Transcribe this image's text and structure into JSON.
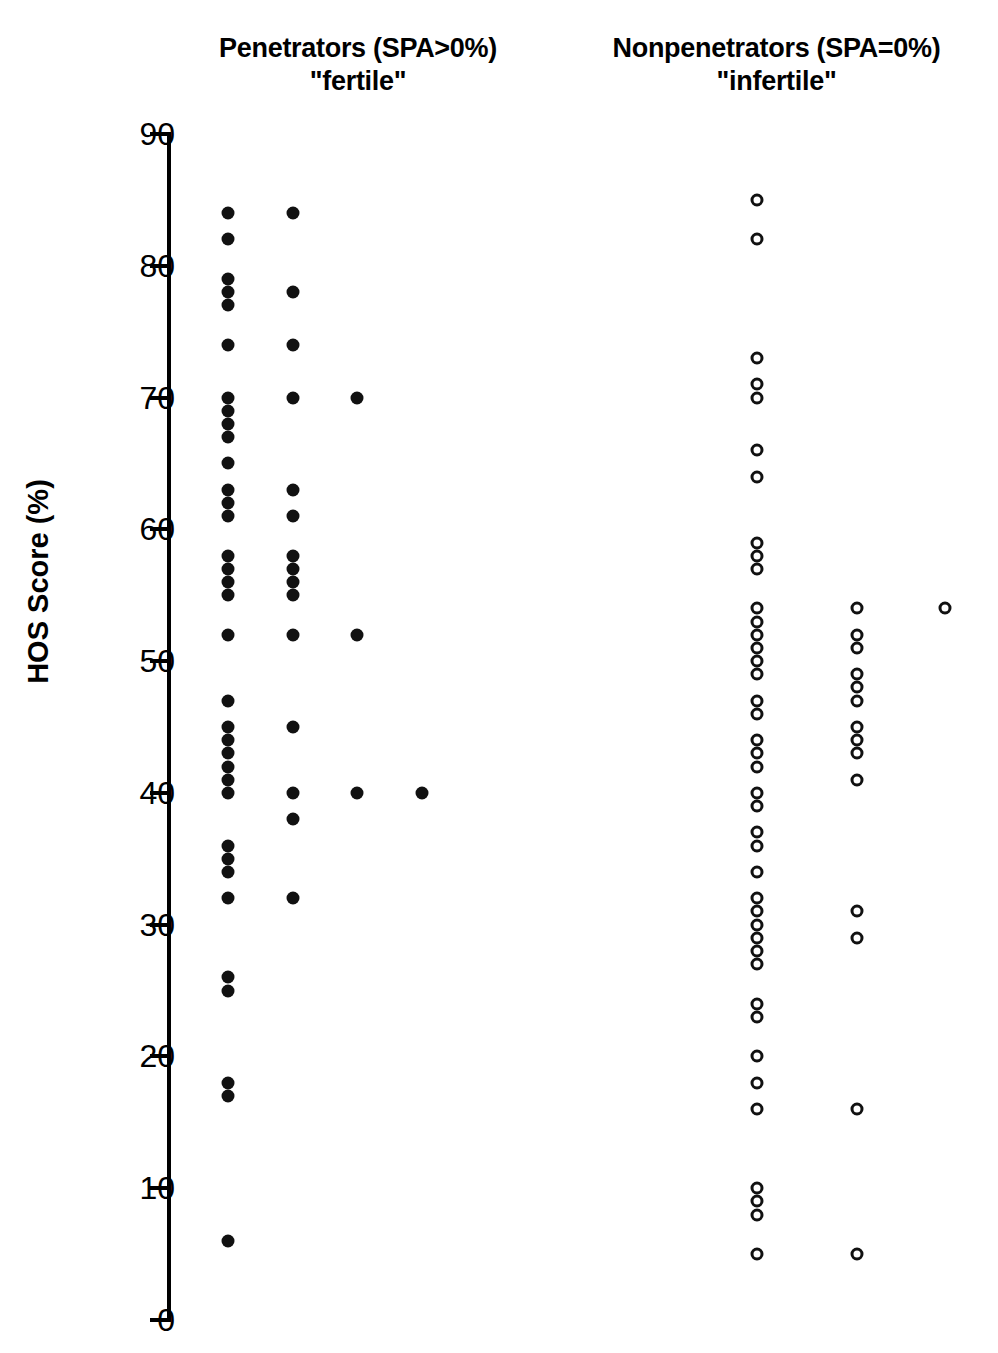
{
  "figure": {
    "ylabel": "HOS Score (%)",
    "ytick_labels": [
      "90",
      "80",
      "70",
      "60",
      "50",
      "40",
      "30",
      "20",
      "10",
      "0"
    ],
    "group_left_title": "Penetrators (SPA>0%)",
    "group_left_subtitle": "\"fertile\"",
    "group_right_title": "Nonpenetrators (SPA=0%)",
    "group_right_subtitle": "\"infertile\"",
    "marker_color": "#111111"
  },
  "chart_data": {
    "type": "scatter",
    "title": "",
    "subtitle": "",
    "xlabel": "",
    "ylabel": "HOS Score (%)",
    "ylim": [
      0,
      90
    ],
    "yticks": [
      0,
      10,
      20,
      30,
      40,
      50,
      60,
      70,
      80,
      90
    ],
    "grid": false,
    "legend_position": "none",
    "axis_style": "single-y-axis-with-outer-ticks",
    "groups": [
      {
        "name": "Penetrators (SPA>0%) \"fertile\"",
        "label_sub": "\"fertile\"",
        "marker": "filled-circle",
        "marker_color": "#111111",
        "columns": [
          {
            "column": 1,
            "x_px": 228,
            "values": [
              84,
              82,
              79,
              78,
              77,
              74,
              70,
              69,
              68,
              67,
              65,
              63,
              62,
              61,
              58,
              57,
              56,
              55,
              52,
              47,
              45,
              44,
              43,
              42,
              41,
              40,
              36,
              35,
              34,
              32,
              26,
              25,
              18,
              17,
              6
            ]
          },
          {
            "column": 2,
            "x_px": 293,
            "values": [
              84,
              78,
              74,
              70,
              63,
              61,
              58,
              57,
              56,
              55,
              52,
              45,
              40,
              38,
              32
            ]
          },
          {
            "column": 3,
            "x_px": 357,
            "values": [
              70,
              52,
              40
            ]
          },
          {
            "column": 4,
            "x_px": 422,
            "values": [
              40
            ]
          }
        ]
      },
      {
        "name": "Nonpenetrators (SPA=0%) \"infertile\"",
        "label_sub": "\"infertile\"",
        "marker": "open-circle",
        "marker_color": "#111111",
        "columns": [
          {
            "column": 1,
            "x_px": 757,
            "values": [
              85,
              82,
              73,
              71,
              70,
              66,
              64,
              59,
              58,
              57,
              54,
              53,
              52,
              51,
              50,
              49,
              47,
              46,
              44,
              43,
              42,
              40,
              39,
              37,
              36,
              34,
              32,
              31,
              30,
              29,
              28,
              27,
              24,
              23,
              20,
              18,
              16,
              10,
              9,
              8,
              5
            ]
          },
          {
            "column": 2,
            "x_px": 857,
            "values": [
              54,
              52,
              51,
              49,
              48,
              47,
              45,
              44,
              43,
              41,
              31,
              29,
              16,
              5
            ]
          },
          {
            "column": 3,
            "x_px": 945,
            "values": [
              54
            ]
          }
        ]
      }
    ]
  }
}
